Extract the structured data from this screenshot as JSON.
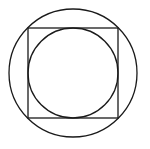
{
  "diagram": {
    "stroke_color": "#1a1a1a",
    "background": "#ffffff",
    "stroke_width": 1.3,
    "outer_circle": {
      "cx": 73,
      "cy": 73,
      "r": 64
    },
    "square": {
      "x": 28,
      "y": 28,
      "width": 90,
      "height": 90
    },
    "inner_circle": {
      "cx": 73,
      "cy": 73,
      "r": 45
    }
  }
}
